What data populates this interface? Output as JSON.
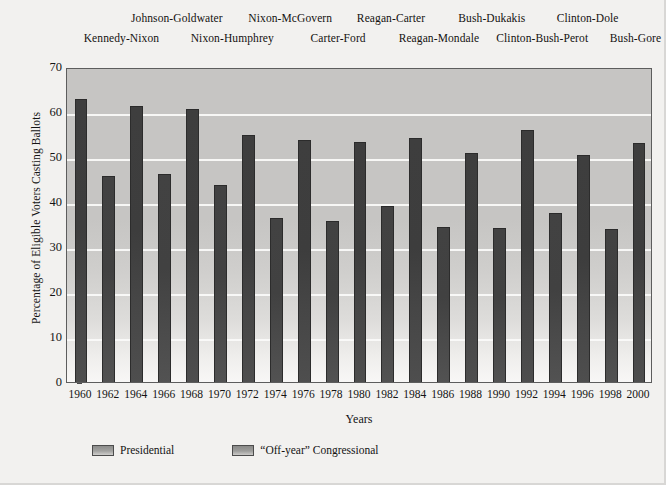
{
  "chart_data": {
    "type": "bar",
    "title": "",
    "xlabel": "Years",
    "ylabel": "Percentage of Eligible Voters Casting Ballots",
    "ylim": [
      0,
      70
    ],
    "ytick_step": 10,
    "yticks": [
      "70",
      "60",
      "50",
      "40",
      "30",
      "20",
      "10",
      "0"
    ],
    "grid": true,
    "grid_axis": "y",
    "legend_position": "bottom-left",
    "categories": [
      "1960",
      "1962",
      "1964",
      "1966",
      "1968",
      "1970",
      "1972",
      "1974",
      "1976",
      "1978",
      "1980",
      "1982",
      "1984",
      "1986",
      "1988",
      "1990",
      "1992",
      "1994",
      "1996",
      "1998",
      "2000"
    ],
    "values": [
      62.8,
      45.8,
      61.4,
      46.2,
      60.7,
      43.7,
      54.8,
      36.4,
      53.8,
      35.8,
      53.4,
      39.1,
      54.2,
      34.4,
      51.0,
      34.3,
      56.0,
      37.6,
      50.5,
      33.9,
      53.1
    ],
    "series": [
      {
        "name": "Presidential",
        "color": "#3e3e3e",
        "points": [
          {
            "year": "1960",
            "value": 62.8
          },
          {
            "year": "1964",
            "value": 61.4
          },
          {
            "year": "1968",
            "value": 60.7
          },
          {
            "year": "1972",
            "value": 54.8
          },
          {
            "year": "1976",
            "value": 53.8
          },
          {
            "year": "1980",
            "value": 53.4
          },
          {
            "year": "1984",
            "value": 54.2
          },
          {
            "year": "1988",
            "value": 51.0
          },
          {
            "year": "1992",
            "value": 56.0
          },
          {
            "year": "1996",
            "value": 50.5
          },
          {
            "year": "2000",
            "value": 53.1
          }
        ]
      },
      {
        "name": "“Off-year” Congressional",
        "color": "#424242",
        "points": [
          {
            "year": "1962",
            "value": 45.8
          },
          {
            "year": "1966",
            "value": 46.2
          },
          {
            "year": "1970",
            "value": 43.7
          },
          {
            "year": "1974",
            "value": 36.4
          },
          {
            "year": "1978",
            "value": 35.8
          },
          {
            "year": "1982",
            "value": 39.1
          },
          {
            "year": "1986",
            "value": 34.4
          },
          {
            "year": "1990",
            "value": 34.3
          },
          {
            "year": "1994",
            "value": 37.6
          },
          {
            "year": "1998",
            "value": 33.9
          }
        ]
      }
    ],
    "annotations": {
      "row_top": [
        {
          "text": "Johnson-Goldwater",
          "x_pct": 22.0
        },
        {
          "text": "Nixon-McGovern",
          "x_pct": 44.5
        },
        {
          "text": "Reagan-Carter",
          "x_pct": 64.5
        },
        {
          "text": "Bush-Dukakis",
          "x_pct": 84.5
        },
        {
          "text": "Clinton-Dole",
          "x_pct": 103.5
        }
      ],
      "row_bottom": [
        {
          "text": "Kennedy-Nixon",
          "x_pct": 11.0
        },
        {
          "text": "Nixon-Humphrey",
          "x_pct": 33.0
        },
        {
          "text": "Carter-Ford",
          "x_pct": 54.0
        },
        {
          "text": "Reagan-Mondale",
          "x_pct": 74.0
        },
        {
          "text": "Clinton-Bush-Perot",
          "x_pct": 94.5
        },
        {
          "text": "Bush-Gore",
          "x_pct": 113.0
        }
      ]
    }
  },
  "legend": {
    "items": [
      {
        "label": "Presidential",
        "swatch": "presidential-swatch"
      },
      {
        "label": "“Off-year” Congressional",
        "swatch": "offyear-swatch"
      }
    ]
  }
}
